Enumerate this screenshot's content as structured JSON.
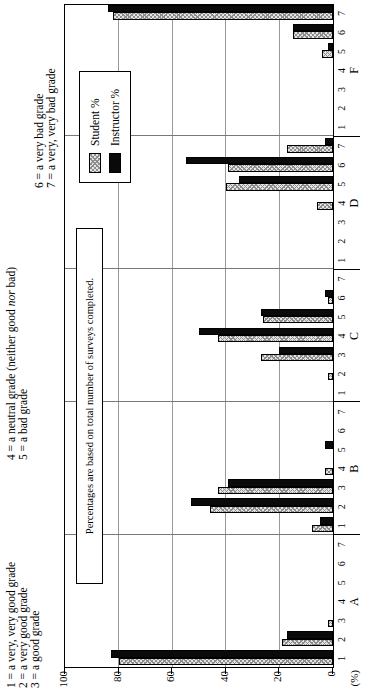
{
  "figure": {
    "scale_legend": {
      "col1": [
        "1 = a very, very good grade",
        "2 = a very good grade",
        "3 = a good grade"
      ],
      "col2_line1": {
        "pre": "4 = a neutral grade (neither good ",
        "italic": "nor",
        "post": " bad)"
      },
      "col2_line2": "5 = a bad grade",
      "col3": [
        "6 = a very bad grade",
        "7 = a very, very bad grade"
      ]
    },
    "note": "Percentages are based on total number of surveys completed.",
    "legend": {
      "student": "Student %",
      "instructor": "Instructor %"
    },
    "y_axis": {
      "unit": "(%)",
      "ticks": [
        100,
        80,
        60,
        40,
        20,
        0
      ]
    }
  },
  "chart_data": {
    "type": "bar",
    "title": "",
    "categories": [
      "A",
      "B",
      "C",
      "D",
      "F"
    ],
    "positions": [
      "1",
      "2",
      "3",
      "4",
      "5",
      "6",
      "7"
    ],
    "series": [
      {
        "name": "Student %",
        "style": "hatched-gray",
        "values": {
          "A": [
            80,
            19,
            2,
            0,
            0,
            0,
            0
          ],
          "B": [
            8,
            46,
            43,
            3,
            0,
            0,
            0
          ],
          "C": [
            0,
            2,
            27,
            43,
            26,
            2,
            0
          ],
          "D": [
            0,
            0,
            0,
            6,
            40,
            39,
            17
          ],
          "F": [
            0,
            0,
            0,
            0,
            4,
            15,
            82
          ]
        }
      },
      {
        "name": "Instructor %",
        "style": "solid-black",
        "values": {
          "A": [
            83,
            17,
            0,
            0,
            0,
            0,
            0
          ],
          "B": [
            5,
            53,
            39,
            0,
            3,
            0,
            0
          ],
          "C": [
            0,
            0,
            20,
            50,
            27,
            3,
            0
          ],
          "D": [
            0,
            0,
            0,
            0,
            35,
            55,
            3
          ],
          "F": [
            0,
            0,
            0,
            0,
            2,
            15,
            84
          ]
        }
      }
    ],
    "ylabel": "(%)",
    "ylim": [
      0,
      100
    ],
    "ytick_step": 20,
    "grid": true,
    "legend_position": "inside-top-right",
    "annotation": "Percentages are based on total number of surveys completed.",
    "layout": "landscape grouped bar chart rotated 90 degrees counterclockwise on a portrait page"
  }
}
